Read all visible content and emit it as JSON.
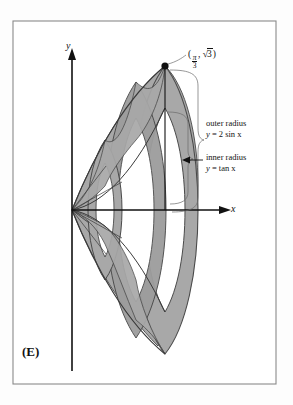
{
  "figure": {
    "choice_label": "(E)",
    "axes": {
      "x_label": "x",
      "y_label": "y",
      "origin_marked": true
    },
    "point": {
      "open_paren": "(",
      "x_numerator": "π",
      "x_denominator": "3",
      "comma": ", ",
      "radical_sign": "√",
      "y_radicand": "3",
      "close_paren": ")",
      "full_text": "(π/3, √3)"
    },
    "annotations": [
      {
        "title": "outer radius",
        "equation_lhs": "y",
        "equation_rel": " = ",
        "equation_rhs": "2 sin x",
        "equation": "y = 2 sin x"
      },
      {
        "title": "inner radius",
        "equation_lhs": "y",
        "equation_rel": " = ",
        "equation_rhs": "tan x",
        "equation": "y = tan x"
      }
    ],
    "colors": {
      "solid_fill": "#a8a8a8",
      "solid_fill_dark": "#949494",
      "outline": "#3a3a3a",
      "axis": "#111111",
      "frame": "#8a8a8a",
      "background": "#fdfdfd"
    }
  }
}
